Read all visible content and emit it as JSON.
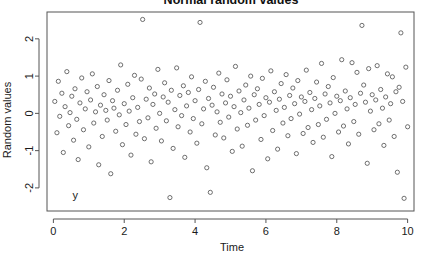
{
  "chart_data": {
    "type": "scatter",
    "title": "Normal random values",
    "xlabel": "Time",
    "ylabel": "Random values",
    "xlim": [
      -0.18,
      10.18
    ],
    "ylim": [
      -2.62,
      2.72
    ],
    "xticks": [
      0,
      2,
      4,
      6,
      8,
      10
    ],
    "xticklabels": [
      "0",
      "2",
      "4",
      "6",
      "8",
      "10"
    ],
    "yticks": [
      -2,
      -1,
      0,
      1,
      2
    ],
    "yticklabels": [
      "-2",
      "-1",
      "0",
      "1",
      "2"
    ],
    "grid": false,
    "legend": null,
    "marker": {
      "shape": "open-circle",
      "radius_px": 2.1,
      "stroke": "#4d4d4d",
      "stroke_width": 0.8,
      "fill": "none"
    },
    "frame_color": "#555555",
    "annotations": [
      {
        "text": "y",
        "x": 0.62,
        "y": -2.18
      }
    ],
    "series": [
      {
        "name": "y",
        "points": [
          [
            0.04,
            0.32
          ],
          [
            0.1,
            -0.52
          ],
          [
            0.14,
            0.86
          ],
          [
            0.18,
            -0.08
          ],
          [
            0.24,
            0.54
          ],
          [
            0.28,
            -1.05
          ],
          [
            0.33,
            0.18
          ],
          [
            0.38,
            1.12
          ],
          [
            0.43,
            -0.33
          ],
          [
            0.47,
            0.02
          ],
          [
            0.52,
            0.46
          ],
          [
            0.57,
            -0.72
          ],
          [
            0.61,
            0.66
          ],
          [
            0.66,
            -0.16
          ],
          [
            0.7,
            -1.24
          ],
          [
            0.75,
            0.28
          ],
          [
            0.8,
            0.95
          ],
          [
            0.85,
            -0.44
          ],
          [
            0.9,
            0.12
          ],
          [
            0.95,
            0.58
          ],
          [
            1.0,
            -0.9
          ],
          [
            1.05,
            0.36
          ],
          [
            1.1,
            1.06
          ],
          [
            1.14,
            -0.26
          ],
          [
            1.19,
            0.04
          ],
          [
            1.24,
            0.72
          ],
          [
            1.28,
            -1.38
          ],
          [
            1.33,
            0.22
          ],
          [
            1.38,
            -0.62
          ],
          [
            1.43,
            0.5
          ],
          [
            1.48,
            0.08
          ],
          [
            1.52,
            -0.18
          ],
          [
            1.57,
            0.88
          ],
          [
            1.62,
            -1.62
          ],
          [
            1.67,
            0.34
          ],
          [
            1.71,
            0.14
          ],
          [
            1.76,
            -0.48
          ],
          [
            1.81,
            0.62
          ],
          [
            1.86,
            -0.04
          ],
          [
            1.9,
            1.3
          ],
          [
            1.95,
            -0.84
          ],
          [
            2.0,
            0.26
          ],
          [
            2.05,
            -0.3
          ],
          [
            2.1,
            0.78
          ],
          [
            2.14,
            0.06
          ],
          [
            2.19,
            -1.12
          ],
          [
            2.24,
            0.42
          ],
          [
            2.29,
            1.02
          ],
          [
            2.33,
            -0.56
          ],
          [
            2.38,
            0.16
          ],
          [
            2.43,
            -0.22
          ],
          [
            2.48,
            0.92
          ],
          [
            2.52,
            2.52
          ],
          [
            2.57,
            -0.68
          ],
          [
            2.62,
            0.38
          ],
          [
            2.67,
            -0.12
          ],
          [
            2.71,
            0.68
          ],
          [
            2.76,
            -1.3
          ],
          [
            2.81,
            0.24
          ],
          [
            2.86,
            0.52
          ],
          [
            2.9,
            -0.4
          ],
          [
            2.95,
            1.18
          ],
          [
            3.0,
            0.0
          ],
          [
            3.05,
            -0.74
          ],
          [
            3.1,
            0.44
          ],
          [
            3.14,
            0.82
          ],
          [
            3.19,
            -0.2
          ],
          [
            3.24,
            0.3
          ],
          [
            3.29,
            -2.26
          ],
          [
            3.33,
            0.62
          ],
          [
            3.38,
            -0.94
          ],
          [
            3.43,
            0.1
          ],
          [
            3.48,
            1.22
          ],
          [
            3.52,
            -0.36
          ],
          [
            3.57,
            0.48
          ],
          [
            3.62,
            -0.06
          ],
          [
            3.67,
            0.74
          ],
          [
            3.71,
            -1.18
          ],
          [
            3.76,
            0.2
          ],
          [
            3.81,
            0.56
          ],
          [
            3.86,
            -0.5
          ],
          [
            3.9,
            0.98
          ],
          [
            3.95,
            -0.14
          ],
          [
            4.0,
            0.34
          ],
          [
            4.05,
            -0.8
          ],
          [
            4.1,
            0.64
          ],
          [
            4.14,
            2.44
          ],
          [
            4.19,
            -0.28
          ],
          [
            4.24,
            0.12
          ],
          [
            4.29,
            0.86
          ],
          [
            4.33,
            -1.46
          ],
          [
            4.38,
            0.4
          ],
          [
            4.43,
            -2.12
          ],
          [
            4.48,
            0.22
          ],
          [
            4.52,
            0.7
          ],
          [
            4.57,
            -0.58
          ],
          [
            4.62,
            0.04
          ],
          [
            4.67,
            1.08
          ],
          [
            4.71,
            -0.24
          ],
          [
            4.76,
            0.52
          ],
          [
            4.81,
            -0.66
          ],
          [
            4.86,
            0.28
          ],
          [
            4.9,
            0.9
          ],
          [
            4.95,
            -0.1
          ],
          [
            5.0,
            0.46
          ],
          [
            5.05,
            -1.02
          ],
          [
            5.1,
            0.18
          ],
          [
            5.14,
            1.26
          ],
          [
            5.19,
            -0.42
          ],
          [
            5.24,
            0.6
          ],
          [
            5.29,
            0.02
          ],
          [
            5.33,
            -0.88
          ],
          [
            5.38,
            0.36
          ],
          [
            5.43,
            0.76
          ],
          [
            5.48,
            -0.32
          ],
          [
            5.52,
            0.14
          ],
          [
            5.57,
            1.0
          ],
          [
            5.62,
            -1.54
          ],
          [
            5.67,
            0.5
          ],
          [
            5.71,
            -0.18
          ],
          [
            5.76,
            0.66
          ],
          [
            5.81,
            0.24
          ],
          [
            5.86,
            -0.7
          ],
          [
            5.9,
            0.94
          ],
          [
            5.95,
            -0.06
          ],
          [
            6.0,
            0.42
          ],
          [
            6.05,
            -1.22
          ],
          [
            6.1,
            0.3
          ],
          [
            6.14,
            1.14
          ],
          [
            6.19,
            -0.46
          ],
          [
            6.24,
            0.58
          ],
          [
            6.29,
            0.08
          ],
          [
            6.33,
            -0.96
          ],
          [
            6.38,
            0.38
          ],
          [
            6.43,
            0.8
          ],
          [
            6.48,
            -0.26
          ],
          [
            6.52,
            0.16
          ],
          [
            6.57,
            1.04
          ],
          [
            6.62,
            -0.6
          ],
          [
            6.67,
            0.48
          ],
          [
            6.71,
            -0.14
          ],
          [
            6.76,
            0.68
          ],
          [
            6.81,
            0.26
          ],
          [
            6.86,
            -1.08
          ],
          [
            6.9,
            0.88
          ],
          [
            6.95,
            -0.02
          ],
          [
            7.0,
            0.44
          ],
          [
            7.05,
            -0.54
          ],
          [
            7.1,
            0.32
          ],
          [
            7.14,
            1.16
          ],
          [
            7.19,
            -0.38
          ],
          [
            7.24,
            0.56
          ],
          [
            7.29,
            0.1
          ],
          [
            7.33,
            -0.78
          ],
          [
            7.38,
            0.4
          ],
          [
            7.43,
            0.84
          ],
          [
            7.48,
            -0.3
          ],
          [
            7.52,
            0.2
          ],
          [
            7.57,
            1.34
          ],
          [
            7.62,
            -0.64
          ],
          [
            7.67,
            0.52
          ],
          [
            7.71,
            -0.16
          ],
          [
            7.76,
            0.72
          ],
          [
            7.81,
            0.28
          ],
          [
            7.86,
            -1.16
          ],
          [
            7.9,
            0.96
          ],
          [
            7.95,
            0.0
          ],
          [
            8.0,
            0.46
          ],
          [
            8.05,
            -0.5
          ],
          [
            8.1,
            0.34
          ],
          [
            8.14,
            1.44
          ],
          [
            8.19,
            -0.34
          ],
          [
            8.24,
            0.6
          ],
          [
            8.29,
            0.12
          ],
          [
            8.33,
            -0.82
          ],
          [
            8.38,
            0.42
          ],
          [
            8.43,
            1.36
          ],
          [
            8.48,
            -0.22
          ],
          [
            8.52,
            0.24
          ],
          [
            8.57,
            1.1
          ],
          [
            8.62,
            -0.56
          ],
          [
            8.67,
            0.54
          ],
          [
            8.71,
            2.36
          ],
          [
            8.76,
            0.76
          ],
          [
            8.81,
            0.3
          ],
          [
            8.86,
            -1.34
          ],
          [
            8.9,
            1.2
          ],
          [
            8.95,
            0.06
          ],
          [
            9.0,
            0.5
          ],
          [
            9.05,
            -0.44
          ],
          [
            9.1,
            0.36
          ],
          [
            9.14,
            1.28
          ],
          [
            9.19,
            -0.28
          ],
          [
            9.24,
            0.64
          ],
          [
            9.29,
            0.14
          ],
          [
            9.33,
            -0.86
          ],
          [
            9.38,
            0.44
          ],
          [
            9.43,
            1.06
          ],
          [
            9.48,
            -0.18
          ],
          [
            9.52,
            0.26
          ],
          [
            9.57,
            0.98
          ],
          [
            9.62,
            -0.62
          ],
          [
            9.67,
            0.58
          ],
          [
            9.71,
            -1.58
          ],
          [
            9.76,
            0.7
          ],
          [
            9.81,
            2.16
          ],
          [
            9.86,
            0.32
          ],
          [
            9.9,
            -2.28
          ],
          [
            9.95,
            1.24
          ],
          [
            10.0,
            -0.36
          ]
        ]
      }
    ]
  }
}
